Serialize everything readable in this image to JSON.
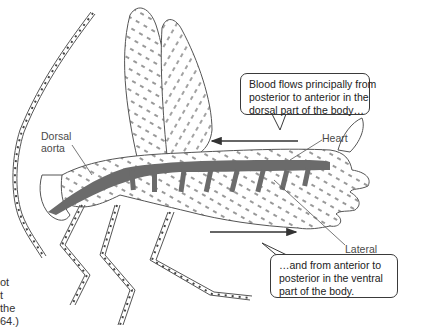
{
  "figure": {
    "labels": {
      "dorsal_aorta": [
        "Dorsal",
        "aorta"
      ],
      "heart": "Heart",
      "lateral_artery": [
        "Lateral",
        "artery"
      ]
    },
    "callouts": {
      "dorsal": [
        "Blood flows principally from",
        "posterior to anterior in the",
        "dorsal part of the body…"
      ],
      "ventral": [
        "…and from anterior to",
        "posterior in the ventral",
        "part of the body."
      ]
    },
    "arrows": {
      "dorsal_direction": "left",
      "ventral_direction": "right"
    },
    "caption_fragment": [
      "ot",
      "t",
      "the",
      "64.)"
    ],
    "colors": {
      "vessel": "#6b6b6b",
      "outline": "#555555",
      "callout_border": "#3a3a3a",
      "text": "#4a4a4a"
    }
  }
}
